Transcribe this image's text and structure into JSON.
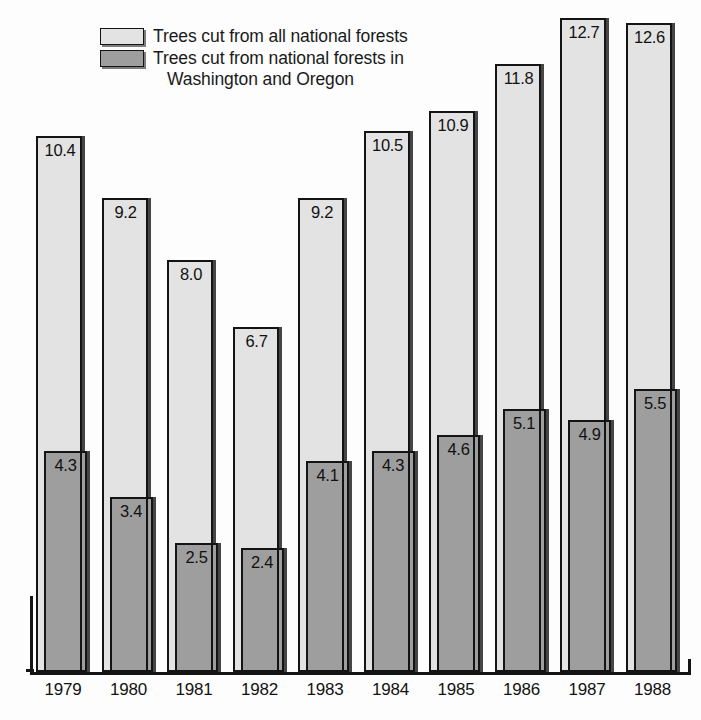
{
  "figure": {
    "width": 701,
    "height": 720,
    "background": "#ffffff"
  },
  "legend": {
    "position": "top-left",
    "items": [
      {
        "swatch": "light",
        "color": "#e3e3e3",
        "line1": "Trees cut from all national forests",
        "line2": ""
      },
      {
        "swatch": "dark",
        "color": "#9e9e9e",
        "line1": "Trees cut from national forests in",
        "line2": "Washington and Oregon"
      }
    ]
  },
  "colors": {
    "light_series": "#e3e3e3",
    "dark_series": "#9e9e9e",
    "outline": "#141414",
    "text": "#131313",
    "background": "#ffffff"
  },
  "axis": {
    "baseline_y": 672,
    "left_x": 30,
    "right_x": 691,
    "px_per_unit": 51.5,
    "grid": false,
    "y_axis_visible": false,
    "y_tick_labels": []
  },
  "chart_data": {
    "type": "bar",
    "title": "",
    "subtitle": "",
    "xlabel": "",
    "ylabel": "",
    "grid": false,
    "legend_position": "top-left",
    "categories": [
      "1979",
      "1980",
      "1981",
      "1982",
      "1983",
      "1984",
      "1985",
      "1986",
      "1987",
      "1988"
    ],
    "series": [
      {
        "name": "Trees cut from all national forests",
        "color": "#e3e3e3",
        "values": [
          10.4,
          9.2,
          8.0,
          6.7,
          9.2,
          10.5,
          10.9,
          11.8,
          12.7,
          12.6
        ],
        "labels": [
          "10.4",
          "9.2",
          "8.0",
          "6.7",
          "9.2",
          "10.5",
          "10.9",
          "11.8",
          "12.7",
          "12.6"
        ]
      },
      {
        "name": "Trees cut from national forests in Washington and Oregon",
        "color": "#9e9e9e",
        "values": [
          4.3,
          3.4,
          2.5,
          2.4,
          4.1,
          4.3,
          4.6,
          5.1,
          4.9,
          5.5
        ],
        "labels": [
          "4.3",
          "3.4",
          "2.5",
          "2.4",
          "4.1",
          "4.3",
          "4.6",
          "5.1",
          "4.9",
          "5.5"
        ]
      }
    ],
    "ylim": [
      0,
      13.1
    ],
    "annotations": []
  }
}
